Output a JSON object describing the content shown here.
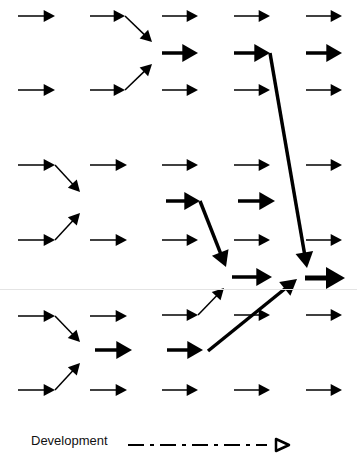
{
  "diagram": {
    "title": "",
    "colors": {
      "arrow": "#000000",
      "background": "#ffffff",
      "divider": "#e4e4e4"
    },
    "grid": {
      "columns_x": [
        18,
        90,
        160,
        232,
        305
      ],
      "rows_y": [
        16,
        52,
        90,
        165,
        202,
        240,
        277,
        315,
        350,
        390
      ]
    },
    "arrows": [
      {
        "x1": 18,
        "y1": 16,
        "x2": 55,
        "y2": 16,
        "w": 1.5
      },
      {
        "x1": 90,
        "y1": 16,
        "x2": 125,
        "y2": 16,
        "w": 1.5
      },
      {
        "x1": 125,
        "y1": 16,
        "x2": 152,
        "y2": 42,
        "w": 1.5
      },
      {
        "x1": 162,
        "y1": 16,
        "x2": 198,
        "y2": 16,
        "w": 1.5
      },
      {
        "x1": 234,
        "y1": 16,
        "x2": 270,
        "y2": 16,
        "w": 1.5
      },
      {
        "x1": 306,
        "y1": 16,
        "x2": 342,
        "y2": 16,
        "w": 1.5
      },
      {
        "x1": 162,
        "y1": 53,
        "x2": 198,
        "y2": 53,
        "w": 3.5
      },
      {
        "x1": 234,
        "y1": 53,
        "x2": 270,
        "y2": 53,
        "w": 3.5
      },
      {
        "x1": 306,
        "y1": 53,
        "x2": 342,
        "y2": 53,
        "w": 3.5
      },
      {
        "x1": 270,
        "y1": 53,
        "x2": 307,
        "y2": 268,
        "w": 3.5
      },
      {
        "x1": 18,
        "y1": 90,
        "x2": 55,
        "y2": 90,
        "w": 1.5
      },
      {
        "x1": 90,
        "y1": 90,
        "x2": 125,
        "y2": 90,
        "w": 1.5
      },
      {
        "x1": 125,
        "y1": 90,
        "x2": 152,
        "y2": 64,
        "w": 1.5
      },
      {
        "x1": 162,
        "y1": 90,
        "x2": 198,
        "y2": 90,
        "w": 1.5
      },
      {
        "x1": 234,
        "y1": 90,
        "x2": 270,
        "y2": 90,
        "w": 1.5
      },
      {
        "x1": 306,
        "y1": 90,
        "x2": 342,
        "y2": 90,
        "w": 1.5
      },
      {
        "x1": 18,
        "y1": 165,
        "x2": 55,
        "y2": 165,
        "w": 1.5
      },
      {
        "x1": 55,
        "y1": 165,
        "x2": 80,
        "y2": 192,
        "w": 1.5
      },
      {
        "x1": 90,
        "y1": 165,
        "x2": 127,
        "y2": 165,
        "w": 1.5
      },
      {
        "x1": 162,
        "y1": 165,
        "x2": 198,
        "y2": 165,
        "w": 1.5
      },
      {
        "x1": 234,
        "y1": 165,
        "x2": 270,
        "y2": 165,
        "w": 1.5
      },
      {
        "x1": 306,
        "y1": 165,
        "x2": 342,
        "y2": 165,
        "w": 1.5
      },
      {
        "x1": 166,
        "y1": 201,
        "x2": 200,
        "y2": 201,
        "w": 3.5
      },
      {
        "x1": 200,
        "y1": 201,
        "x2": 226,
        "y2": 267,
        "w": 3.5
      },
      {
        "x1": 238,
        "y1": 201,
        "x2": 275,
        "y2": 201,
        "w": 3.5
      },
      {
        "x1": 18,
        "y1": 240,
        "x2": 55,
        "y2": 240,
        "w": 1.5
      },
      {
        "x1": 55,
        "y1": 240,
        "x2": 80,
        "y2": 213,
        "w": 1.5
      },
      {
        "x1": 90,
        "y1": 240,
        "x2": 127,
        "y2": 240,
        "w": 1.5
      },
      {
        "x1": 162,
        "y1": 240,
        "x2": 198,
        "y2": 240,
        "w": 1.5
      },
      {
        "x1": 234,
        "y1": 240,
        "x2": 270,
        "y2": 240,
        "w": 1.5
      },
      {
        "x1": 306,
        "y1": 240,
        "x2": 342,
        "y2": 240,
        "w": 1.5
      },
      {
        "x1": 232,
        "y1": 277,
        "x2": 272,
        "y2": 277,
        "w": 3.5
      },
      {
        "x1": 305,
        "y1": 278,
        "x2": 345,
        "y2": 278,
        "w": 5
      },
      {
        "x1": 18,
        "y1": 316,
        "x2": 55,
        "y2": 316,
        "w": 1.5
      },
      {
        "x1": 55,
        "y1": 316,
        "x2": 80,
        "y2": 342,
        "w": 1.5
      },
      {
        "x1": 90,
        "y1": 316,
        "x2": 127,
        "y2": 316,
        "w": 1.5
      },
      {
        "x1": 162,
        "y1": 315,
        "x2": 198,
        "y2": 315,
        "w": 1.5
      },
      {
        "x1": 198,
        "y1": 315,
        "x2": 224,
        "y2": 288,
        "w": 1.5
      },
      {
        "x1": 234,
        "y1": 315,
        "x2": 270,
        "y2": 315,
        "w": 1.5
      },
      {
        "x1": 306,
        "y1": 315,
        "x2": 342,
        "y2": 315,
        "w": 1.5
      },
      {
        "x1": 95,
        "y1": 350,
        "x2": 132,
        "y2": 350,
        "w": 3.5
      },
      {
        "x1": 167,
        "y1": 350,
        "x2": 203,
        "y2": 350,
        "w": 3.5
      },
      {
        "x1": 208,
        "y1": 351,
        "x2": 297,
        "y2": 279,
        "w": 3.5
      },
      {
        "x1": 18,
        "y1": 390,
        "x2": 55,
        "y2": 390,
        "w": 1.5
      },
      {
        "x1": 55,
        "y1": 390,
        "x2": 80,
        "y2": 363,
        "w": 1.5
      },
      {
        "x1": 90,
        "y1": 390,
        "x2": 127,
        "y2": 390,
        "w": 1.5
      },
      {
        "x1": 162,
        "y1": 390,
        "x2": 198,
        "y2": 390,
        "w": 1.5
      },
      {
        "x1": 234,
        "y1": 390,
        "x2": 270,
        "y2": 390,
        "w": 1.5
      },
      {
        "x1": 306,
        "y1": 390,
        "x2": 342,
        "y2": 390,
        "w": 1.5
      }
    ]
  },
  "legend": {
    "label": "Development",
    "line_style": "dash-dot",
    "arrowhead": "open-triangle"
  }
}
